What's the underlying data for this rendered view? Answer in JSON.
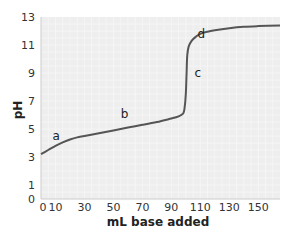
{
  "chart_data": {
    "type": "line",
    "title": "",
    "xlabel": "mL base added",
    "ylabel": "pH",
    "xlim": [
      0,
      165
    ],
    "ylim": [
      0,
      13
    ],
    "grid": true,
    "x_ticks": [
      "0",
      "10",
      "30",
      "50",
      "70",
      "90",
      "110",
      "130",
      "150"
    ],
    "x_tick_values": [
      0,
      10,
      30,
      50,
      70,
      90,
      110,
      130,
      150
    ],
    "y_ticks": [
      "0",
      "1",
      "3",
      "5",
      "7",
      "9",
      "11",
      "13"
    ],
    "y_tick_values": [
      0,
      1,
      3,
      5,
      7,
      9,
      11,
      13
    ],
    "series": [
      {
        "name": "titration curve",
        "color": "#555555",
        "x": [
          0,
          5,
          10,
          15,
          20,
          25,
          30,
          40,
          50,
          60,
          70,
          80,
          90,
          95,
          98,
          99,
          100,
          100.5,
          101,
          102,
          104,
          107,
          110,
          115,
          120,
          130,
          140,
          150,
          165
        ],
        "y": [
          3.2,
          3.5,
          3.8,
          4.05,
          4.25,
          4.4,
          4.5,
          4.7,
          4.9,
          5.1,
          5.3,
          5.5,
          5.75,
          5.9,
          6.1,
          6.4,
          7.5,
          9.0,
          10.3,
          10.9,
          11.3,
          11.6,
          11.8,
          11.95,
          12.05,
          12.2,
          12.3,
          12.35,
          12.4
        ]
      }
    ],
    "annotations": [
      {
        "text": "a",
        "x": 8,
        "y": 4.2
      },
      {
        "text": "b",
        "x": 55,
        "y": 5.8
      },
      {
        "text": "c",
        "x": 106,
        "y": 8.7
      },
      {
        "text": "d",
        "x": 108,
        "y": 11.5
      }
    ]
  },
  "colors": {
    "plot_background": "#eeeeee",
    "grid": "#f8f8f8",
    "line": "#555555"
  }
}
